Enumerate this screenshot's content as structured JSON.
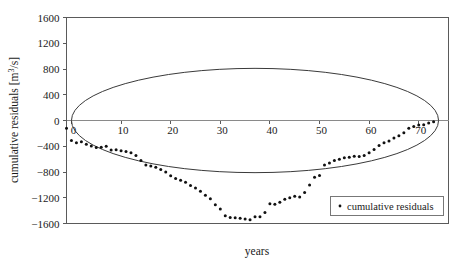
{
  "chart_data": {
    "type": "scatter",
    "title": "",
    "xlabel": "years",
    "ylabel": "cumulative residuals [m³/s]",
    "xlim": [
      -1,
      76
    ],
    "ylim": [
      -1600,
      1600
    ],
    "xticks": [
      0,
      10,
      20,
      30,
      40,
      50,
      60,
      70
    ],
    "xtick_labels": [
      "0",
      "10",
      "20",
      "30",
      "40",
      "50",
      "60",
      "70"
    ],
    "yticks": [
      -1600,
      -1200,
      -800,
      -400,
      0,
      400,
      800,
      1200,
      1600
    ],
    "ytick_labels": [
      "-1600",
      "-1200",
      "-800",
      "-400",
      "0",
      "400",
      "800",
      "1200",
      "1600"
    ],
    "grid": false,
    "legend_position": "lower-right",
    "series": [
      {
        "name": "cumulative residuals",
        "marker": "dot",
        "color": "#111111",
        "x": [
          -1,
          0,
          1,
          2,
          3,
          4,
          5,
          6,
          7,
          8,
          9,
          10,
          11,
          12,
          13,
          14,
          15,
          16,
          17,
          18,
          19,
          20,
          21,
          22,
          23,
          24,
          25,
          26,
          27,
          28,
          29,
          30,
          31,
          32,
          33,
          34,
          35,
          36,
          37,
          38,
          39,
          40,
          41,
          42,
          43,
          44,
          45,
          46,
          47,
          48,
          49,
          50,
          51,
          52,
          53,
          54,
          55,
          56,
          57,
          58,
          59,
          60,
          61,
          62,
          63,
          64,
          65,
          66,
          67,
          68,
          69,
          70,
          71,
          72,
          73
        ],
        "y": [
          -120,
          -310,
          -345,
          -330,
          -370,
          -395,
          -420,
          -415,
          -400,
          -460,
          -455,
          -470,
          -480,
          -500,
          -545,
          -620,
          -690,
          -705,
          -725,
          -760,
          -800,
          -860,
          -900,
          -930,
          -960,
          -1010,
          -1050,
          -1100,
          -1160,
          -1215,
          -1310,
          -1375,
          -1480,
          -1505,
          -1510,
          -1520,
          -1530,
          -1540,
          -1495,
          -1495,
          -1430,
          -1295,
          -1300,
          -1270,
          -1225,
          -1200,
          -1175,
          -1190,
          -1120,
          -1000,
          -880,
          -855,
          -690,
          -660,
          -620,
          -600,
          -580,
          -570,
          -555,
          -560,
          -545,
          -500,
          -450,
          -390,
          -345,
          -320,
          -270,
          -235,
          -190,
          -120,
          -95,
          -70,
          -65,
          -40,
          -20
        ]
      }
    ],
    "envelope": {
      "name": "confidence ellipse",
      "type": "ellipse",
      "x_center": 37,
      "x_semi_axis": 37,
      "y_center": 0,
      "y_semi_axis": 810,
      "color": "#3a3a3a"
    },
    "zero_line": 0
  },
  "legend": {
    "entries": [
      {
        "label": "cumulative residuals",
        "marker": "dot",
        "color": "#111111"
      }
    ]
  },
  "axes": {
    "x_title": "years",
    "y_title": "cumulative residuals [m³/s]"
  }
}
